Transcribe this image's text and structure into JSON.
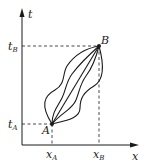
{
  "diagram": {
    "axes": {
      "x_label": "x",
      "y_label": "t"
    },
    "points": [
      {
        "name": "A",
        "x_label": "x",
        "x_sub": "A",
        "t_label": "t",
        "t_sub": "A"
      },
      {
        "name": "B",
        "x_label": "x",
        "x_sub": "B",
        "t_label": "t",
        "t_sub": "B"
      }
    ],
    "paths_count": 5,
    "colors": {
      "ink": "#1a1a1a",
      "background": "#ffffff"
    }
  }
}
